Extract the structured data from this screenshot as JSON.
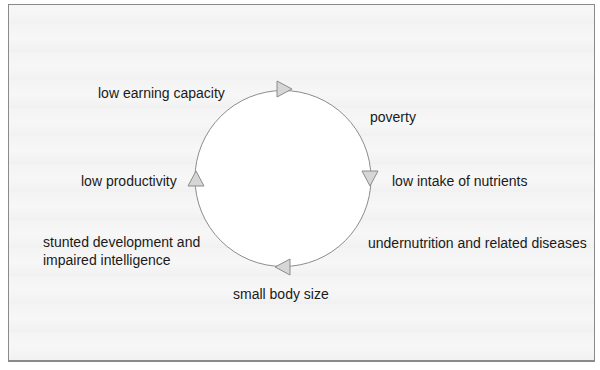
{
  "diagram": {
    "type": "cycle",
    "direction": "clockwise",
    "colors": {
      "circle_stroke": "#8c8c8c",
      "arrow_fill": "#d6d6d6",
      "arrow_stroke": "#8c8c8c",
      "text": "#1a1a1a",
      "frame_border": "#8a8a8a",
      "background": "#f7f7f7"
    },
    "nodes": [
      {
        "id": "poverty",
        "label": "poverty"
      },
      {
        "id": "low-intake",
        "label": "low intake of nutrients"
      },
      {
        "id": "undernutrition",
        "label": "undernutrition and related diseases"
      },
      {
        "id": "small-body",
        "label": "small body size"
      },
      {
        "id": "stunted",
        "label": "stunted development and impaired intelligence"
      },
      {
        "id": "low-productivity",
        "label": "low productivity"
      },
      {
        "id": "low-earning",
        "label": "low earning capacity"
      }
    ],
    "arrows": [
      {
        "position": "top",
        "points": "right"
      },
      {
        "position": "right",
        "points": "down"
      },
      {
        "position": "bottom",
        "points": "left"
      },
      {
        "position": "left",
        "points": "up"
      }
    ]
  }
}
